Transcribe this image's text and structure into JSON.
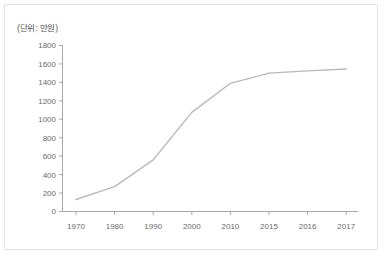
{
  "chart_data": {
    "type": "line",
    "title": "",
    "subtitle": "",
    "unit_label": "(단위: 만원)",
    "xlabel": "",
    "ylabel": "",
    "categories": [
      "1970",
      "1980",
      "1990",
      "2000",
      "2010",
      "2015",
      "2016",
      "2017"
    ],
    "values": [
      130,
      270,
      560,
      1075,
      1390,
      1500,
      1525,
      1545
    ],
    "series": [
      {
        "name": "",
        "values": [
          130,
          270,
          560,
          1075,
          1390,
          1500,
          1525,
          1545
        ]
      }
    ],
    "ylim": [
      0,
      1800
    ],
    "ytick_labels": [
      "0",
      "200",
      "400",
      "600",
      "800",
      "1000",
      "1200",
      "1400",
      "1600",
      "1800"
    ],
    "ytick_values": [
      0,
      200,
      400,
      600,
      800,
      1000,
      1200,
      1400,
      1600,
      1800
    ],
    "xtick_labels": [
      "1970",
      "1980",
      "1990",
      "2000",
      "2010",
      "2015",
      "2016",
      "2017"
    ],
    "grid": false,
    "legend": "none",
    "line_color": "#b9b9b9",
    "axis_color": "#9a9a9a",
    "text_color": "#6b6b6b",
    "border_color": "#e2e2e2",
    "background_color": "#ffffff"
  }
}
